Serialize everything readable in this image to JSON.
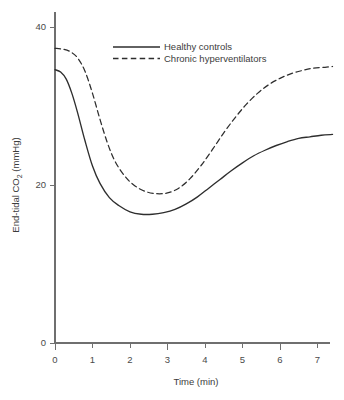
{
  "chart_data": {
    "type": "line",
    "title": "",
    "xlabel": "Time (min)",
    "ylabel": "End-tidal CO2 (mmHg)",
    "ylabel_prefix": "End-tidal CO",
    "ylabel_subscript": "2",
    "ylabel_suffix": " (mmHg)",
    "xlim": [
      0,
      7.5
    ],
    "ylim": [
      0,
      41
    ],
    "xticks": [
      0,
      1,
      2,
      3,
      4,
      5,
      6,
      7
    ],
    "xtick_labels": [
      "0",
      "1",
      "2",
      "3",
      "4",
      "5",
      "6",
      "7"
    ],
    "yticks": [
      0,
      20,
      40
    ],
    "ytick_labels": [
      "0",
      "20",
      "40"
    ],
    "grid": false,
    "legend_position": "top-center",
    "legend": [
      "Healthy controls",
      "Chronic hyperventilators"
    ],
    "series": [
      {
        "name": "Healthy controls",
        "style": "solid",
        "color": "#2e2e2e",
        "x": [
          0.0,
          0.15,
          0.3,
          0.45,
          0.6,
          0.8,
          1.0,
          1.2,
          1.45,
          1.7,
          2.0,
          2.3,
          2.6,
          2.9,
          3.2,
          3.5,
          3.8,
          4.1,
          4.4,
          4.7,
          5.0,
          5.3,
          5.6,
          5.9,
          6.2,
          6.5,
          6.8,
          7.1,
          7.4
        ],
        "y": [
          34.6,
          34.3,
          33.4,
          31.6,
          29.2,
          25.6,
          22.4,
          20.2,
          18.4,
          17.4,
          16.6,
          16.3,
          16.3,
          16.5,
          16.9,
          17.6,
          18.5,
          19.6,
          20.7,
          21.8,
          22.8,
          23.7,
          24.4,
          25.0,
          25.5,
          25.9,
          26.1,
          26.3,
          26.4
        ]
      },
      {
        "name": "Chronic hyperventilators",
        "style": "dashed",
        "color": "#2e2e2e",
        "x": [
          0.0,
          0.2,
          0.4,
          0.6,
          0.8,
          1.0,
          1.2,
          1.4,
          1.6,
          1.85,
          2.1,
          2.4,
          2.7,
          3.0,
          3.3,
          3.6,
          3.9,
          4.2,
          4.5,
          4.8,
          5.1,
          5.4,
          5.7,
          6.0,
          6.3,
          6.6,
          6.9,
          7.2,
          7.4
        ],
        "y": [
          37.3,
          37.2,
          36.9,
          36.1,
          34.4,
          31.6,
          28.3,
          25.3,
          23.0,
          21.2,
          20.0,
          19.2,
          18.9,
          19.0,
          19.6,
          20.8,
          22.5,
          24.5,
          26.6,
          28.5,
          30.2,
          31.6,
          32.7,
          33.5,
          34.1,
          34.5,
          34.8,
          34.9,
          35.0
        ]
      }
    ]
  },
  "axis_label_x": "Time (min)"
}
